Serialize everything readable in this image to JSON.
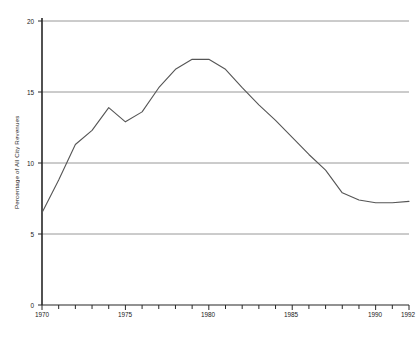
{
  "chart_data": {
    "type": "line",
    "title": "",
    "xlabel": "",
    "ylabel": "Percentage of All City Revenues",
    "xlim": [
      1970,
      1992
    ],
    "ylim": [
      0,
      20
    ],
    "grid": "horizontal",
    "legend": "none",
    "y_ticks": [
      0,
      5,
      10,
      15,
      20
    ],
    "y_tick_labels": [
      "0",
      "5",
      "10",
      "15",
      "20"
    ],
    "x_ticks": [
      1970,
      1971,
      1972,
      1973,
      1974,
      1975,
      1976,
      1977,
      1978,
      1979,
      1980,
      1981,
      1982,
      1983,
      1984,
      1985,
      1986,
      1987,
      1988,
      1989,
      1990,
      1991,
      1992
    ],
    "x_tick_labels_shown": [
      "1970",
      "1975",
      "1980",
      "1985",
      "1990",
      "1992"
    ],
    "x_tick_label_years": [
      1970,
      1975,
      1980,
      1985,
      1990,
      1992
    ],
    "series": [
      {
        "name": "Percentage of All City Revenues",
        "color": "#555555",
        "x": [
          1970,
          1971,
          1972,
          1973,
          1974,
          1975,
          1976,
          1977,
          1978,
          1979,
          1980,
          1981,
          1982,
          1983,
          1984,
          1985,
          1986,
          1987,
          1988,
          1989,
          1990,
          1991,
          1992
        ],
        "values": [
          6.5,
          8.8,
          11.3,
          12.3,
          13.9,
          12.9,
          13.6,
          15.3,
          16.6,
          17.3,
          17.3,
          16.6,
          15.3,
          14.1,
          13.0,
          11.8,
          10.6,
          9.5,
          7.9,
          7.4,
          7.2,
          7.2,
          7.3
        ]
      }
    ]
  },
  "caption": ""
}
